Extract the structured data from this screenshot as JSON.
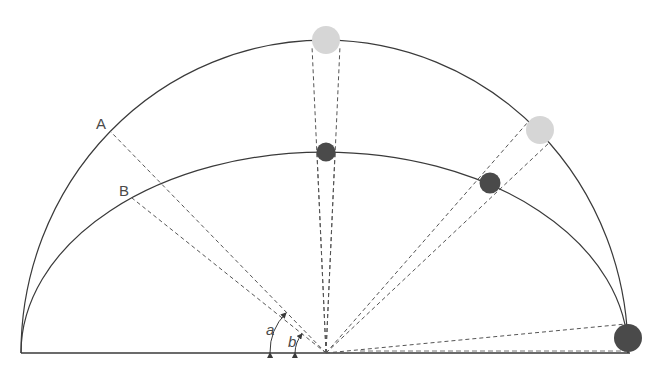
{
  "diagram": {
    "type": "celestial-sphere-altitude",
    "labels": {
      "point_outer": "A",
      "point_inner": "B",
      "angle_outer": "a",
      "angle_inner": "b"
    },
    "colors": {
      "line": "#3a3a3a",
      "dashed": "#555555",
      "light_body": "#d6d6d6",
      "dark_body": "#4a4a4a",
      "background": "#ffffff"
    },
    "elements": [
      {
        "name": "outer-arc",
        "description": "Outer celestial arc"
      },
      {
        "name": "inner-arc",
        "description": "Inner flattened arc"
      },
      {
        "name": "horizon-line",
        "description": "Horizon baseline"
      },
      {
        "name": "observer-point",
        "description": "Observer at center of horizon"
      },
      {
        "name": "light-body-zenith",
        "description": "Light sphere at zenith of outer arc"
      },
      {
        "name": "dark-body-zenith",
        "description": "Dark sphere at top of inner arc"
      },
      {
        "name": "light-body-mid",
        "description": "Light sphere on outer arc at mid altitude"
      },
      {
        "name": "dark-body-mid",
        "description": "Dark sphere on inner arc at mid altitude"
      },
      {
        "name": "dark-body-horizon",
        "description": "Dark sphere at the horizon"
      }
    ]
  }
}
